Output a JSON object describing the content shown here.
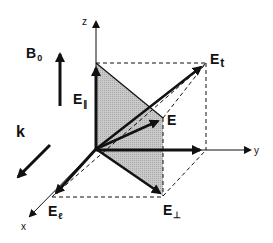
{
  "diagram": {
    "type": "3d-vector-decomposition",
    "colors": {
      "line": "#111111",
      "shade": "#c8c8c8",
      "background": "#ffffff"
    },
    "axes": {
      "x": {
        "label": "x"
      },
      "y": {
        "label": "y"
      },
      "z": {
        "label": "z"
      }
    },
    "field_indicators": {
      "B0": {
        "main": "B",
        "sub": "0",
        "direction": "up"
      },
      "k": {
        "label": "k",
        "direction": "toward x"
      }
    },
    "vectors": {
      "E": {
        "main": "E",
        "sub": ""
      },
      "E_t": {
        "main": "E",
        "sub": "t"
      },
      "E_parallel": {
        "main": "E",
        "sub": "∥"
      },
      "E_perp": {
        "main": "E",
        "sub": "⊥"
      },
      "E_ell": {
        "main": "E",
        "sub": "ℓ"
      }
    }
  }
}
